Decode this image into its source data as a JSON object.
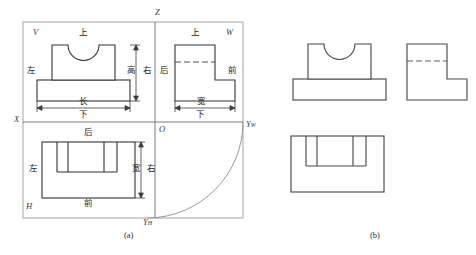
{
  "figure": {
    "kind": "orthographic-projection-diagram",
    "captions": [
      {
        "text": "(a)",
        "x": 131,
        "y": 238
      },
      {
        "text": "(b)",
        "x": 377,
        "y": 238
      }
    ],
    "axes": {
      "z_label": "Z",
      "x_label": "X",
      "o_label": "O",
      "yw_label": "Y",
      "yw_sub": "W",
      "yh_label": "Y",
      "yh_sub": "H"
    },
    "planes": [
      {
        "name": "V",
        "label": "V"
      },
      {
        "name": "W",
        "label": "W"
      },
      {
        "name": "H",
        "label": "H"
      }
    ],
    "direction_labels": {
      "up": "上",
      "down": "下",
      "left": "左",
      "right": "右",
      "front": "前",
      "back": "后"
    },
    "dimension_labels": {
      "length": "长",
      "width": "宽",
      "height": "高"
    },
    "v_view": {
      "plane_label": "V",
      "up": "上",
      "down": "下",
      "left": "左",
      "right": "右",
      "length_dim": "长",
      "height_dim": "高"
    },
    "w_view": {
      "plane_label": "W",
      "up": "上",
      "down": "下",
      "back": "后",
      "front": "前",
      "width_dim": "宽"
    },
    "h_view": {
      "plane_label": "H",
      "back": "后",
      "front": "前",
      "left": "左",
      "right": "右",
      "width_dim": "宽"
    },
    "colors": {
      "line": "#3a3a3a",
      "frame": "#8a8a8a",
      "object": "#303030",
      "background": "#ffffff",
      "hidden": "#5a5a5a"
    }
  }
}
